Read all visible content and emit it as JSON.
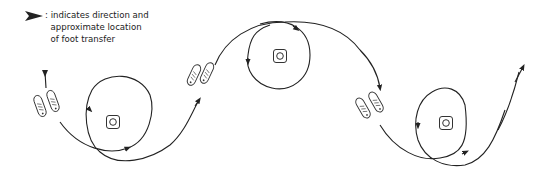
{
  "legend": {
    "symbol": "direction-arrow",
    "separator": ":",
    "lines": [
      "indicates direction and",
      "approximate  location",
      "of foot transfer"
    ]
  },
  "diagram": {
    "stroke_color": "#222222",
    "elements": [
      {
        "type": "circle-loop",
        "center_marker": "square-with-circle",
        "cx": 113,
        "cy": 122
      },
      {
        "type": "circle-loop",
        "center_marker": "square-with-circle",
        "cx": 280,
        "cy": 57
      },
      {
        "type": "circle-loop",
        "center_marker": "square-with-circle",
        "cx": 445,
        "cy": 123
      }
    ],
    "foot_pairs": [
      {
        "x": 42,
        "y": 100,
        "label": "foot-transfer-1"
      },
      {
        "x": 200,
        "y": 70,
        "label": "foot-transfer-2"
      },
      {
        "x": 364,
        "y": 100,
        "label": "foot-transfer-3"
      }
    ]
  }
}
